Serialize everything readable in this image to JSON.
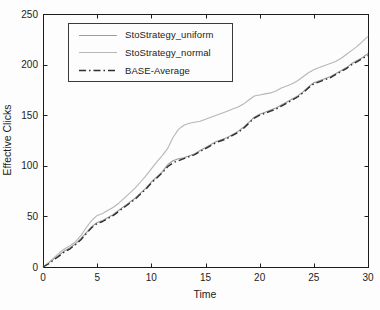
{
  "chart_data": {
    "type": "line",
    "title": "",
    "xlabel": "Time",
    "ylabel": "Effective Clicks",
    "xlim": [
      0,
      30
    ],
    "ylim": [
      0,
      250
    ],
    "xticks": [
      0,
      5,
      10,
      15,
      20,
      25,
      30
    ],
    "yticks": [
      0,
      50,
      100,
      150,
      200,
      250
    ],
    "grid": false,
    "legend_position": "upper-left",
    "axis_color": "#1c1c1c",
    "x": [
      0,
      0.5,
      1,
      1.5,
      2,
      2.5,
      3,
      3.5,
      4,
      4.5,
      5,
      5.5,
      6,
      6.5,
      7,
      7.5,
      8,
      8.5,
      9,
      9.5,
      10,
      10.5,
      11,
      11.5,
      12,
      12.5,
      13,
      13.5,
      14,
      14.5,
      15,
      15.5,
      16,
      16.5,
      17,
      17.5,
      18,
      18.5,
      19,
      19.5,
      20,
      20.5,
      21,
      21.5,
      22,
      22.5,
      23,
      23.5,
      24,
      24.5,
      25,
      25.5,
      26,
      26.5,
      27,
      27.5,
      28,
      28.5,
      29,
      29.5,
      30
    ],
    "series": [
      {
        "name": "StoStrategy_uniform",
        "color": "#9c9c9c",
        "style": "solid",
        "values": [
          0,
          4,
          8,
          12,
          16,
          19,
          23,
          28,
          34,
          40,
          44,
          46,
          49,
          52,
          56,
          60,
          64,
          68,
          73,
          78,
          84,
          89,
          94,
          101,
          105,
          107,
          108,
          110,
          112,
          115,
          118,
          121,
          124,
          126,
          128,
          131,
          134,
          138,
          143,
          148,
          151,
          153,
          155,
          157,
          160,
          163,
          166,
          169,
          173,
          178,
          182,
          184,
          186,
          188,
          191,
          194,
          197,
          201,
          204,
          207,
          211
        ]
      },
      {
        "name": "StoStrategy_normal",
        "color": "#b6b6b6",
        "style": "solid",
        "values": [
          0,
          4,
          9,
          14,
          18,
          21,
          25,
          31,
          39,
          46,
          51,
          53,
          56,
          59,
          63,
          68,
          73,
          78,
          84,
          90,
          97,
          104,
          110,
          117,
          128,
          136,
          140,
          142,
          143,
          144,
          146,
          148,
          150,
          152,
          154,
          156,
          158,
          161,
          165,
          169,
          170,
          171,
          172,
          174,
          177,
          179,
          181,
          184,
          188,
          192,
          195,
          197,
          199,
          201,
          203,
          206,
          210,
          214,
          218,
          223,
          228
        ]
      },
      {
        "name": "BASE-Average",
        "color": "#2e2e2e",
        "style": "dash-dot",
        "values": [
          0,
          3,
          7,
          11,
          15,
          18,
          22,
          27,
          33,
          39,
          43,
          45,
          48,
          51,
          55,
          59,
          63,
          67,
          72,
          77,
          83,
          88,
          93,
          99,
          103,
          105,
          107,
          109,
          111,
          114,
          117,
          120,
          123,
          125,
          127,
          130,
          133,
          137,
          142,
          147,
          150,
          152,
          154,
          156,
          159,
          162,
          165,
          168,
          172,
          177,
          181,
          183,
          185,
          187,
          190,
          193,
          196,
          200,
          203,
          206,
          209
        ]
      }
    ]
  }
}
